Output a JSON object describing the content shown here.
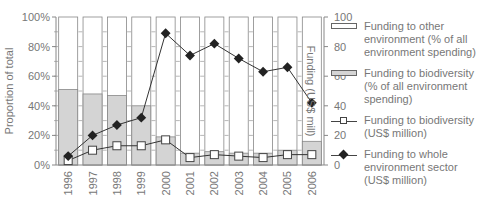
{
  "chart_data": {
    "type": "bar+line",
    "title": "",
    "categories": [
      "1996",
      "1997",
      "1998",
      "1999",
      "2000",
      "2001",
      "2002",
      "2003",
      "2004",
      "2005",
      "2006"
    ],
    "left_axis": {
      "label": "Proportion of total",
      "ticks": [
        "0%",
        "20%",
        "40%",
        "60%",
        "80%",
        "100%"
      ],
      "range": [
        0,
        100
      ]
    },
    "right_axis": {
      "label": "Funding (US$ mill)",
      "ticks": [
        "0",
        "20",
        "40",
        "60",
        "80",
        "100"
      ],
      "range": [
        0,
        100
      ]
    },
    "series": [
      {
        "name": "Funding to other environment (% of all environment spending)",
        "type": "stacked-bar",
        "axis": "left",
        "color": "#ffffff",
        "values": [
          49,
          52,
          53,
          60,
          81,
          92,
          91,
          92,
          92,
          90,
          84
        ]
      },
      {
        "name": "Funding to biodiversity (% of all environment spending)",
        "type": "stacked-bar",
        "axis": "left",
        "color": "#d4d4d4",
        "values": [
          51,
          48,
          47,
          40,
          19,
          8,
          9,
          8,
          8,
          10,
          16
        ]
      },
      {
        "name": "Funding to biodiversity (US$ million)",
        "type": "line",
        "axis": "right",
        "marker": "open-square",
        "values": [
          3,
          10,
          13,
          13,
          17,
          5,
          7,
          6,
          5,
          7,
          7
        ]
      },
      {
        "name": "Funding to whole environment sector (US$ million)",
        "type": "line",
        "axis": "right",
        "marker": "filled-diamond",
        "values": [
          6,
          20,
          27,
          32,
          89,
          74,
          82,
          72,
          63,
          66,
          42
        ]
      }
    ],
    "grid": false,
    "legend_position": "right"
  },
  "legend": {
    "items": [
      {
        "symbol": "open-bar",
        "lines": [
          "Funding to other",
          "environment (% of all",
          "environment spending)"
        ]
      },
      {
        "symbol": "grey-bar",
        "lines": [
          "Funding to biodiversity",
          "(% of all environment",
          "spending)"
        ]
      },
      {
        "symbol": "line-square",
        "lines": [
          "Funding to biodiversity",
          "(US$ million)"
        ]
      },
      {
        "symbol": "line-diamond",
        "lines": [
          "Funding to whole",
          "environment sector",
          "(US$ million)"
        ]
      }
    ]
  }
}
